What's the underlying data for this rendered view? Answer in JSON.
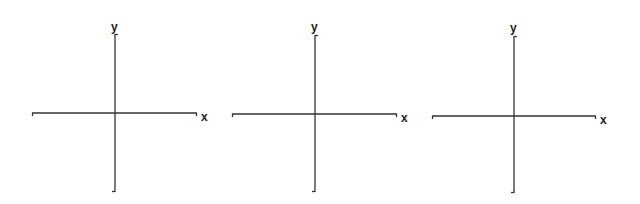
{
  "diagram": {
    "type": "coordinate-axes",
    "count": 3,
    "line_color": "#333333",
    "axes": [
      {
        "x_label": "x",
        "y_label": "y",
        "origin": [
          115,
          113
        ],
        "h_range": [
          32,
          197
        ],
        "v_range": [
          32,
          192
        ]
      },
      {
        "x_label": "x",
        "y_label": "y",
        "origin": [
          315,
          114
        ],
        "h_range": [
          232,
          397
        ],
        "v_range": [
          33,
          192
        ]
      },
      {
        "x_label": "x",
        "y_label": "y",
        "origin": [
          514,
          116
        ],
        "h_range": [
          432,
          596
        ],
        "v_range": [
          35,
          193
        ]
      }
    ]
  }
}
